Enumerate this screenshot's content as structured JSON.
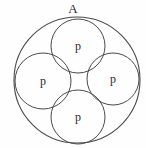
{
  "figure": {
    "title_label": "A",
    "background_color": "#fefefe",
    "stroke_color": "#4a4a4a",
    "text_color": "#2a2a2a",
    "width": 146,
    "height": 148
  },
  "outer_circle": {
    "label": "A",
    "cx": 77,
    "cy": 80,
    "r": 63
  },
  "inner_circles": [
    {
      "id": "top",
      "label": "p",
      "cx": 78,
      "cy": 46,
      "r": 27
    },
    {
      "id": "left",
      "label": "p",
      "cx": 43,
      "cy": 81,
      "r": 28
    },
    {
      "id": "right",
      "label": "p",
      "cx": 113,
      "cy": 79,
      "r": 26
    },
    {
      "id": "bottom",
      "label": "p",
      "cx": 78,
      "cy": 117,
      "r": 27
    }
  ],
  "chart_data": {
    "type": "diagram",
    "title": "A",
    "shapes": [
      {
        "shape": "circle",
        "label": "A",
        "cx": 77,
        "cy": 80,
        "r": 63,
        "role": "enclosing-circle"
      },
      {
        "shape": "circle",
        "label": "p",
        "cx": 78,
        "cy": 46,
        "r": 27,
        "role": "inner-circle-top"
      },
      {
        "shape": "circle",
        "label": "p",
        "cx": 43,
        "cy": 81,
        "r": 28,
        "role": "inner-circle-left"
      },
      {
        "shape": "circle",
        "label": "p",
        "cx": 113,
        "cy": 79,
        "r": 26,
        "role": "inner-circle-right"
      },
      {
        "shape": "circle",
        "label": "p",
        "cx": 78,
        "cy": 117,
        "r": 27,
        "role": "inner-circle-bottom"
      }
    ],
    "labels": [
      "A",
      "p",
      "p",
      "p",
      "p"
    ]
  }
}
